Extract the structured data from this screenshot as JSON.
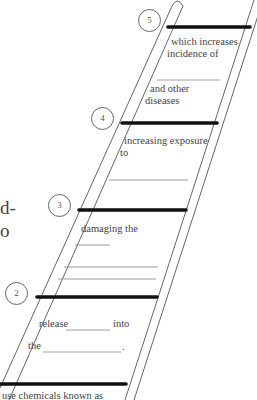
{
  "side_text": {
    "line1": "d-",
    "line2": "o"
  },
  "steps": [
    {
      "number": "5",
      "text_lines": [
        "which increases",
        "incidence of"
      ],
      "after_blank": [
        "and other",
        "diseases"
      ]
    },
    {
      "number": "4",
      "text_lines": [
        "increasing exposure",
        "to"
      ]
    },
    {
      "number": "3",
      "text_lines": [
        "damaging the"
      ]
    },
    {
      "number": "2",
      "text_parts": [
        "release",
        "into",
        "the",
        "."
      ]
    },
    {
      "number": "1",
      "text_lines": [
        "use chemicals known as"
      ]
    }
  ],
  "colors": {
    "rung": "#111111",
    "rail": "#555555",
    "blank_line": "#777777"
  }
}
